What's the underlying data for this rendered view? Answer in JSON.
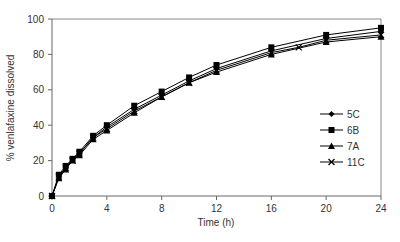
{
  "chart_data": {
    "type": "line",
    "title": "",
    "xlabel": "Time (h)",
    "ylabel": "% venlafaxine dissolved",
    "xlim": [
      0,
      24
    ],
    "ylim": [
      0,
      100
    ],
    "xticks": [
      0,
      4,
      8,
      12,
      16,
      20,
      24
    ],
    "yticks": [
      0,
      20,
      40,
      60,
      80,
      100
    ],
    "grid": false,
    "legend_position": "inside-right",
    "series": [
      {
        "name": "5C",
        "marker": "diamond",
        "x": [
          0,
          0.5,
          1,
          1.5,
          2,
          3,
          4,
          6,
          8,
          10,
          12,
          16,
          20,
          24
        ],
        "y": [
          0,
          11,
          16,
          21,
          24,
          33,
          39,
          49,
          57,
          65,
          72,
          82,
          89,
          93
        ]
      },
      {
        "name": "6B",
        "marker": "square",
        "x": [
          0,
          0.5,
          1,
          1.5,
          2,
          3,
          4,
          6,
          8,
          10,
          12,
          16,
          20,
          24
        ],
        "y": [
          0,
          12,
          17,
          21,
          25,
          34,
          40,
          51,
          59,
          67,
          74,
          84,
          91,
          95
        ]
      },
      {
        "name": "7A",
        "marker": "triangle",
        "x": [
          0,
          0.5,
          1,
          1.5,
          2,
          3,
          4,
          6,
          8,
          10,
          12,
          16,
          20,
          24
        ],
        "y": [
          0,
          10,
          15,
          20,
          23,
          32,
          37,
          47,
          56,
          64,
          70,
          80,
          87,
          90
        ]
      },
      {
        "name": "11C",
        "marker": "x",
        "x": [
          0,
          0.5,
          1,
          1.5,
          2,
          3,
          4,
          6,
          8,
          10,
          12,
          16,
          18,
          20,
          24
        ],
        "y": [
          0,
          11,
          16,
          20,
          24,
          33,
          38,
          48,
          56,
          64,
          71,
          81,
          84,
          88,
          91
        ]
      }
    ]
  }
}
